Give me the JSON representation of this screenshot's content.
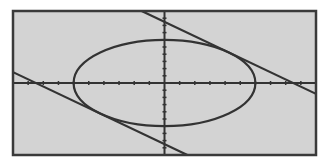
{
  "chart_data": {
    "type": "line",
    "title": "",
    "xlabel": "",
    "ylabel": "",
    "xlim": [
      -10,
      10
    ],
    "ylim": [
      -10,
      10
    ],
    "xscl": 1,
    "yscl": 1,
    "grid": false,
    "legend": "none",
    "series": [
      {
        "name": "circle x^2 + y^2 = 36",
        "kind": "conic",
        "cx": 0,
        "cy": 0,
        "rx": 6,
        "ry": 6
      },
      {
        "name": "tangent line y = -x + 8.49",
        "kind": "line",
        "slope": -1,
        "intercept": 8.49
      },
      {
        "name": "tangent line y = -x - 8.49",
        "kind": "line",
        "slope": -1,
        "intercept": -8.49
      }
    ]
  },
  "style": {
    "background": "#ffffff",
    "screen_color": "#d3d3d3",
    "frame_color": "#3a3a3a",
    "curve_color": "#333333",
    "axis_color": "#333333"
  },
  "layout": {
    "frame": {
      "x": 13,
      "y": 11,
      "w": 303,
      "h": 144
    }
  }
}
